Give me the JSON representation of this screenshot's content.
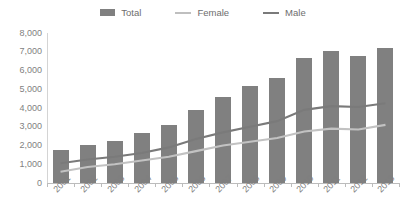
{
  "legend": {
    "position": "top-center",
    "items": [
      {
        "label": "Total",
        "marker": "bar",
        "color": "#808080"
      },
      {
        "label": "Female",
        "marker": "line",
        "color": "#bfbfbf"
      },
      {
        "label": "Male",
        "marker": "line",
        "color": "#7a7a7a"
      }
    ]
  },
  "axes": {
    "y_ticks": [
      "8,000",
      "7,000",
      "6,000",
      "5,000",
      "4,000",
      "3,000",
      "2,000",
      "1,000",
      "0"
    ],
    "x_ticks": [
      "2001",
      "2002",
      "2003",
      "2004",
      "2005",
      "2006",
      "2007",
      "2008",
      "2009",
      "2010",
      "2011",
      "2012",
      "2013"
    ]
  },
  "colors": {
    "total_bar": "#808080",
    "female_line": "#bfbfbf",
    "male_line": "#7a7a7a",
    "axis": "#bcbcbc",
    "text": "#7f7f7f",
    "background": "#ffffff"
  },
  "chart_data": {
    "type": "bar",
    "title": "",
    "subtitle": "",
    "xlabel": "",
    "ylabel": "",
    "ylim": [
      0,
      8000
    ],
    "ytick_step": 1000,
    "grid": false,
    "legend_position": "top-center",
    "categories": [
      "2001",
      "2002",
      "2003",
      "2004",
      "2005",
      "2006",
      "2007",
      "2008",
      "2009",
      "2010",
      "2011",
      "2012",
      "2013"
    ],
    "series": [
      {
        "name": "Total",
        "type": "bar",
        "color": "#808080",
        "values": [
          1750,
          2050,
          2250,
          2650,
          3100,
          3900,
          4600,
          5150,
          5600,
          6650,
          7050,
          6800,
          7200
        ]
      },
      {
        "name": "Female",
        "type": "line",
        "color": "#bfbfbf",
        "values": [
          600,
          850,
          1000,
          1200,
          1400,
          1700,
          2000,
          2200,
          2400,
          2750,
          2900,
          2850,
          3100
        ]
      },
      {
        "name": "Male",
        "type": "line",
        "color": "#7a7a7a",
        "values": [
          1050,
          1250,
          1400,
          1600,
          1900,
          2350,
          2700,
          3000,
          3300,
          3900,
          4100,
          4050,
          4250
        ]
      }
    ]
  }
}
